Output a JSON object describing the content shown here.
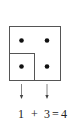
{
  "diagram": {
    "colors": {
      "stroke": "#555555",
      "dot": "#111111",
      "text": "#222222"
    },
    "outer_square": {
      "label": "outer-square",
      "dots": 4
    },
    "inner_square": {
      "label": "inner-square",
      "dots": 1
    },
    "equation": {
      "left": "1",
      "plus": "+",
      "right": "3",
      "equals": "=",
      "result": "4"
    }
  }
}
